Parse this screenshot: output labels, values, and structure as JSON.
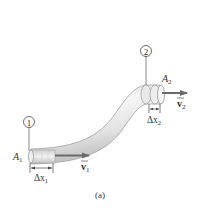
{
  "figure": {
    "caption": "(a)"
  },
  "points": [
    {
      "id": "1",
      "marker": "1",
      "area_label": "A",
      "area_sub": "1",
      "disp_label": "Δx",
      "disp_sub": "1",
      "vel_label": "v",
      "vel_sub": "1"
    },
    {
      "id": "2",
      "marker": "2",
      "area_label": "A",
      "area_sub": "2",
      "disp_label": "Δx",
      "disp_sub": "2",
      "vel_label": "v",
      "vel_sub": "2"
    }
  ],
  "colors": {
    "tube_light": "#f4f4f4",
    "tube_mid": "#dcdcdc",
    "tube_dark": "#b8b8b8",
    "outline": "#9a9a9a",
    "arrow": "#6a6a6a",
    "text": "#333333"
  }
}
